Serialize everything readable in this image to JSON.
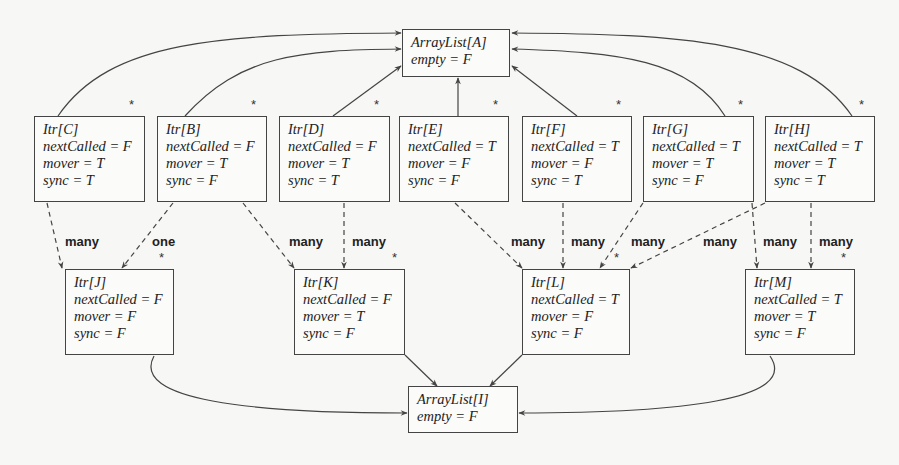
{
  "diagram": {
    "arraylists": [
      {
        "id": "A",
        "title": "ArrayList[A]",
        "empty": "empty = F",
        "x": 402,
        "y": 29,
        "w": 108,
        "h": 48
      },
      {
        "id": "I",
        "title": "ArrayList[I]",
        "empty": "empty = F",
        "x": 408,
        "y": 386,
        "w": 110,
        "h": 47
      }
    ],
    "iterators": [
      {
        "id": "C",
        "title": "Itr[C]",
        "nextCalled": "nextCalled = F",
        "mover": "mover = T",
        "sync": "sync = T",
        "x": 34,
        "y": 116,
        "w": 111,
        "h": 86
      },
      {
        "id": "B",
        "title": "Itr[B]",
        "nextCalled": "nextCalled = F",
        "mover": "mover = T",
        "sync": "sync = F",
        "x": 157,
        "y": 116,
        "w": 110,
        "h": 86
      },
      {
        "id": "D",
        "title": "Itr[D]",
        "nextCalled": "nextCalled = F",
        "mover": "mover = T",
        "sync": "sync = T",
        "x": 279,
        "y": 116,
        "w": 111,
        "h": 86
      },
      {
        "id": "E",
        "title": "Itr[E]",
        "nextCalled": "nextCalled = T",
        "mover": "mover = F",
        "sync": "sync = F",
        "x": 399,
        "y": 116,
        "w": 110,
        "h": 86
      },
      {
        "id": "F",
        "title": "Itr[F]",
        "nextCalled": "nextCalled = T",
        "mover": "mover = F",
        "sync": "sync = T",
        "x": 522,
        "y": 116,
        "w": 110,
        "h": 86
      },
      {
        "id": "G",
        "title": "Itr[G]",
        "nextCalled": "nextCalled = T",
        "mover": "mover = T",
        "sync": "sync = F",
        "x": 643,
        "y": 116,
        "w": 111,
        "h": 86
      },
      {
        "id": "H",
        "title": "Itr[H]",
        "nextCalled": "nextCalled = T",
        "mover": "mover = T",
        "sync": "sync = T",
        "x": 765,
        "y": 116,
        "w": 110,
        "h": 86
      },
      {
        "id": "J",
        "title": "Itr[J]",
        "nextCalled": "nextCalled = F",
        "mover": "mover = F",
        "sync": "sync = F",
        "x": 65,
        "y": 269,
        "w": 109,
        "h": 86
      },
      {
        "id": "K",
        "title": "Itr[K]",
        "nextCalled": "nextCalled = F",
        "mover": "mover = T",
        "sync": "sync = F",
        "x": 294,
        "y": 269,
        "w": 111,
        "h": 86
      },
      {
        "id": "L",
        "title": "Itr[L]",
        "nextCalled": "nextCalled = T",
        "mover": "mover = F",
        "sync": "sync = F",
        "x": 522,
        "y": 269,
        "w": 108,
        "h": 86
      },
      {
        "id": "M",
        "title": "Itr[M]",
        "nextCalled": "nextCalled = T",
        "mover": "mover = T",
        "sync": "sync = F",
        "x": 745,
        "y": 269,
        "w": 110,
        "h": 86
      }
    ],
    "multiplicity_marker": "*",
    "stars": [
      {
        "x": 129,
        "y": 97
      },
      {
        "x": 251,
        "y": 97
      },
      {
        "x": 374,
        "y": 97
      },
      {
        "x": 493,
        "y": 97
      },
      {
        "x": 616,
        "y": 97
      },
      {
        "x": 738,
        "y": 97
      },
      {
        "x": 859,
        "y": 97
      },
      {
        "x": 159,
        "y": 250
      },
      {
        "x": 392,
        "y": 250
      },
      {
        "x": 614,
        "y": 250
      },
      {
        "x": 841,
        "y": 250
      }
    ],
    "edge_labels": [
      {
        "text": "many",
        "x": 65,
        "y": 234
      },
      {
        "text": "one",
        "x": 152,
        "y": 234
      },
      {
        "text": "many",
        "x": 289,
        "y": 234
      },
      {
        "text": "many",
        "x": 352,
        "y": 234
      },
      {
        "text": "many",
        "x": 511,
        "y": 234
      },
      {
        "text": "many",
        "x": 571,
        "y": 234
      },
      {
        "text": "many",
        "x": 631,
        "y": 234
      },
      {
        "text": "many",
        "x": 703,
        "y": 234
      },
      {
        "text": "many",
        "x": 763,
        "y": 234
      },
      {
        "text": "many",
        "x": 819,
        "y": 234
      }
    ],
    "solid_edges": [
      {
        "from": "C",
        "to": "A"
      },
      {
        "from": "B",
        "to": "A"
      },
      {
        "from": "D",
        "to": "A"
      },
      {
        "from": "E",
        "to": "A"
      },
      {
        "from": "F",
        "to": "A"
      },
      {
        "from": "G",
        "to": "A"
      },
      {
        "from": "H",
        "to": "A"
      },
      {
        "from": "J",
        "to": "I"
      },
      {
        "from": "K",
        "to": "I"
      },
      {
        "from": "L",
        "to": "I"
      },
      {
        "from": "M",
        "to": "I"
      }
    ],
    "dashed_edges": [
      {
        "from": "C",
        "to": "J",
        "label": "many"
      },
      {
        "from": "B",
        "to": "J",
        "label": "one"
      },
      {
        "from": "B",
        "to": "K",
        "label": "many"
      },
      {
        "from": "D",
        "to": "K",
        "label": "many"
      },
      {
        "from": "E",
        "to": "L",
        "label": "many"
      },
      {
        "from": "F",
        "to": "L",
        "label": "many"
      },
      {
        "from": "G",
        "to": "L",
        "label": "many"
      },
      {
        "from": "H",
        "to": "L",
        "label": "many"
      },
      {
        "from": "G",
        "to": "M",
        "label": "many"
      },
      {
        "from": "H",
        "to": "M",
        "label": "many"
      }
    ],
    "colors": {
      "line": "#444444",
      "background": "#f7f7f5"
    }
  }
}
